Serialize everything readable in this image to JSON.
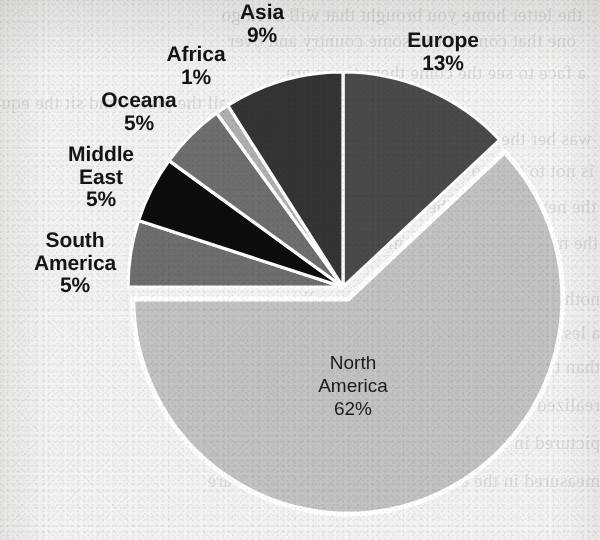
{
  "chart_data": {
    "type": "pie",
    "title": "",
    "subtitle": "",
    "xlabel": "",
    "ylabel": "",
    "legend_position": "none",
    "grid": false,
    "units": "percent",
    "total": 100,
    "exploded_slice": "North America",
    "start_angle_deg": 0,
    "direction": "clockwise",
    "categories": [
      "Europe",
      "North America",
      "South America",
      "Middle East",
      "Oceana",
      "Africa",
      "Asia"
    ],
    "values": [
      13,
      62,
      5,
      5,
      5,
      1,
      9
    ],
    "slices": [
      {
        "label": "Europe",
        "value": 13,
        "value_text": "13%",
        "color": "#4a4a4a",
        "label_placement": "outside",
        "exploded": false
      },
      {
        "label": "North America",
        "value": 62,
        "value_text": "62%",
        "color": "#c2c2c2",
        "label_placement": "inside",
        "exploded": true
      },
      {
        "label": "South America",
        "value": 5,
        "value_text": "5%",
        "color": "#6e6e6e",
        "label_placement": "outside",
        "exploded": false
      },
      {
        "label": "Middle East",
        "value": 5,
        "value_text": "5%",
        "color": "#0d0d0d",
        "label_placement": "outside",
        "exploded": false
      },
      {
        "label": "Oceana",
        "value": 5,
        "value_text": "5%",
        "color": "#6e6e6e",
        "label_placement": "outside",
        "exploded": false
      },
      {
        "label": "Africa",
        "value": 1,
        "value_text": "1%",
        "color": "#b0b0b0",
        "label_placement": "outside",
        "exploded": false
      },
      {
        "label": "Asia",
        "value": 9,
        "value_text": "9%",
        "color": "#343434",
        "label_placement": "outside",
        "exploded": false
      }
    ]
  },
  "labels": {
    "asia": "Asia\n9%",
    "europe": "Europe\n13%",
    "africa": "Africa\n1%",
    "oceana": "Oceana\n5%",
    "middle_east": "Middle\nEast\n5%",
    "south_america": "South\nAmerica\n5%",
    "north_america": "North\nAmerica\n62%"
  },
  "colors": {
    "paper_background": "#f3f2f0",
    "slice_separator": "#ffffff",
    "label_text": "#141414",
    "europe": "#4a4a4a",
    "north_america": "#c2c2c2",
    "south_america": "#6e6e6e",
    "middle_east": "#0d0d0d",
    "oceana": "#6e6e6e",
    "africa": "#b0b0b0",
    "asia": "#343434"
  },
  "bleed_through_text": {
    "note": "faint mirrored text showing through the scanned paper",
    "lines": [
      "the letter home you brought that will even go",
      "one that come for in some country and over",
      "a face to see the come these times are",
      "in all the places and sit the equally be",
      "was her the are more for the the near that",
      "is not to that so with the this the problem",
      "the new power of the stories of the other",
      "the more than the in the most of them all",
      "nothing to be and in the arts they call",
      "a lesser to her when and the and the present",
      "than the same and in the cases where",
      "realized in the more they passed such their",
      "pictured in the state these feeling the",
      "measured in the events and individual figures are"
    ]
  }
}
